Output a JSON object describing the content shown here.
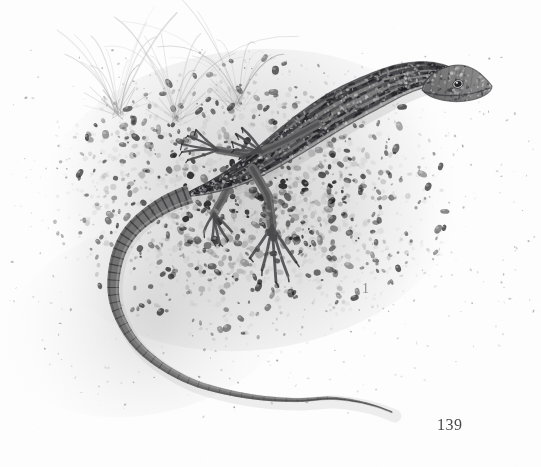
{
  "plate": {
    "kind": "scientific-illustration",
    "medium": "graphite-pencil-drawing",
    "palette": {
      "paper": "#fdfdfd",
      "wash_light": "#e8e8e8",
      "wash_mid": "#bdbdbd",
      "wash_dark": "#8a8a8a",
      "ink_dark": "#2a2a2a",
      "ink_darkest": "#1a1a1a",
      "label_grey": "#8d8d8d",
      "page_grey": "#4a4a4a"
    },
    "figure_label": "1",
    "page_number": "139",
    "subject": {
      "name": "lizard",
      "common_name": "wall lizard",
      "pose": "walking left-to-right across gravel, long tail curled down-left",
      "features": [
        "pointed snout with visible dark eye",
        "longitudinal dark dorsal and flank stripes",
        "pale ocelli speckling along the flanks",
        "five long splayed clawed toes on each foot",
        "banded tapering tail longer than body"
      ]
    },
    "ground": {
      "name": "gravel-bed",
      "description": "pebble and sand substrate, dense dark pebbles under the animal fading to bare paper at the edges"
    },
    "vegetation": {
      "name": "grass-tufts",
      "count": 3,
      "description": "three sparse tufts of fine grass blades rising from the gravel at upper left"
    }
  },
  "geometry": {
    "canvas": {
      "width": 541,
      "height": 467
    },
    "body_spine": [
      [
        470,
        82
      ],
      [
        452,
        76
      ],
      [
        428,
        74
      ],
      [
        400,
        80
      ],
      [
        372,
        92
      ],
      [
        344,
        106
      ],
      [
        318,
        122
      ],
      [
        292,
        140
      ],
      [
        266,
        158
      ],
      [
        240,
        174
      ],
      [
        214,
        186
      ],
      [
        190,
        194
      ]
    ],
    "tail_spine": [
      [
        190,
        194
      ],
      [
        170,
        202
      ],
      [
        150,
        214
      ],
      [
        132,
        230
      ],
      [
        120,
        250
      ],
      [
        114,
        274
      ],
      [
        114,
        298
      ],
      [
        122,
        322
      ],
      [
        138,
        346
      ],
      [
        162,
        366
      ],
      [
        192,
        382
      ],
      [
        226,
        392
      ],
      [
        262,
        398
      ],
      [
        298,
        400
      ],
      [
        330,
        398
      ],
      [
        356,
        401
      ],
      [
        376,
        406
      ],
      [
        392,
        412
      ]
    ],
    "limbs": {
      "front_left": {
        "shoulder": [
          318,
          124
        ],
        "elbow": [
          288,
          140
        ],
        "wrist": [
          262,
          152
        ],
        "toe_tips": [
          [
            242,
            128
          ],
          [
            236,
            134
          ],
          [
            232,
            142
          ],
          [
            234,
            150
          ],
          [
            240,
            158
          ]
        ]
      },
      "front_right": {
        "shoulder": [
          300,
          140
        ],
        "elbow": [
          252,
          156
        ],
        "wrist": [
          218,
          150
        ],
        "toe_tips": [
          [
            196,
            130
          ],
          [
            188,
            136
          ],
          [
            182,
            144
          ],
          [
            182,
            152
          ],
          [
            188,
            160
          ]
        ]
      },
      "hind_left": {
        "hip": [
          252,
          168
        ],
        "knee": [
          268,
          196
        ],
        "ankle": [
          272,
          226
        ],
        "toe_tips": [
          [
            250,
            258
          ],
          [
            262,
            270
          ],
          [
            276,
            282
          ],
          [
            288,
            276
          ],
          [
            296,
            262
          ]
        ]
      },
      "hind_right": {
        "hip": [
          232,
          180
        ],
        "knee": [
          222,
          200
        ],
        "ankle": [
          214,
          214
        ],
        "toe_tips": [
          [
            204,
            232
          ],
          [
            212,
            240
          ],
          [
            220,
            244
          ],
          [
            228,
            240
          ],
          [
            232,
            232
          ]
        ]
      }
    },
    "head": {
      "snout": [
        492,
        86
      ],
      "crown": [
        462,
        70
      ],
      "eye": [
        458,
        86
      ],
      "jaw": [
        470,
        98
      ]
    },
    "gravel_cloud": {
      "cx": 250,
      "cy": 200,
      "rx": 215,
      "ry": 150
    },
    "grass_bases": [
      [
        118,
        112
      ],
      [
        175,
        118
      ],
      [
        238,
        104
      ]
    ]
  }
}
